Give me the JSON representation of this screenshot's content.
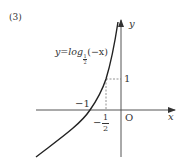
{
  "problem_label": "(3)",
  "equation": {
    "prefix": "y=log",
    "base_num": "1",
    "base_den": "2",
    "suffix": "(−x)"
  },
  "axes": {
    "x_label": "x",
    "y_label": "y",
    "origin_label": "O"
  },
  "ticks": {
    "y_one": "1",
    "x_minus_one": "−1",
    "x_minus_half_sign": "−",
    "x_minus_half_num": "1",
    "x_minus_half_den": "2"
  },
  "colors": {
    "curve": "#222222",
    "axis": "#555555",
    "dashed": "#777777"
  }
}
